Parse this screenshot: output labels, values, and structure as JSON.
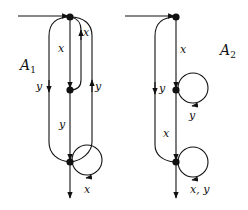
{
  "diagram": {
    "automata": [
      {
        "name": "A1",
        "label_main": "A",
        "label_sub": "1",
        "states": [
          "top",
          "middle",
          "bottom"
        ],
        "edges": [
          {
            "from": "start",
            "to": "top",
            "label": ""
          },
          {
            "from": "top",
            "to": "middle",
            "label": "x"
          },
          {
            "from": "middle",
            "to": "top",
            "label": "x"
          },
          {
            "from": "top",
            "to": "bottom",
            "label": "y",
            "side": "left"
          },
          {
            "from": "bottom",
            "to": "top",
            "label": "y",
            "side": "right"
          },
          {
            "from": "middle",
            "to": "bottom",
            "label": "y"
          },
          {
            "from": "bottom",
            "to": "bottom",
            "label": "x",
            "type": "self-loop"
          },
          {
            "from": "bottom",
            "to": "exit",
            "label": ""
          }
        ]
      },
      {
        "name": "A2",
        "label_main": "A",
        "label_sub": "2",
        "states": [
          "top",
          "middle",
          "bottom"
        ],
        "edges": [
          {
            "from": "start",
            "to": "top",
            "label": ""
          },
          {
            "from": "top",
            "to": "middle",
            "label": "x"
          },
          {
            "from": "top",
            "to": "bottom",
            "label": "y",
            "side": "left"
          },
          {
            "from": "middle",
            "to": "middle",
            "label": "y",
            "type": "self-loop"
          },
          {
            "from": "middle",
            "to": "bottom",
            "label": "x"
          },
          {
            "from": "bottom",
            "to": "bottom",
            "label": "x, y",
            "type": "self-loop"
          },
          {
            "from": "bottom",
            "to": "exit",
            "label": ""
          }
        ]
      }
    ],
    "labels": {
      "a1_x_down": "x",
      "a1_x_up": "x",
      "a1_y_left": "y",
      "a1_y_right": "y",
      "a1_y_mid": "y",
      "a1_loop": "x",
      "a2_x_top": "x",
      "a2_y_left": "y",
      "a2_loop_mid": "y",
      "a2_x_mid": "x",
      "a2_loop_bottom": "x, y"
    }
  }
}
